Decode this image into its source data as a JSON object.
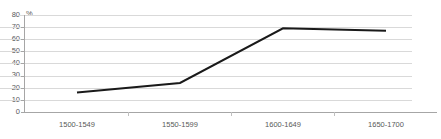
{
  "chart_data": {
    "type": "line",
    "title": "",
    "subtitle": "",
    "xlabel": "",
    "ylabel": "%",
    "unit_label": "%",
    "categories": [
      "1500-1549",
      "1550-1599",
      "1600-1649",
      "1650-1700"
    ],
    "values": [
      16,
      24,
      69,
      67
    ],
    "series": [
      {
        "name": "",
        "values": [
          16,
          24,
          69,
          67
        ]
      }
    ],
    "ylim": [
      0,
      80
    ],
    "ytick_step": 10,
    "yticks": [
      0,
      10,
      20,
      30,
      40,
      50,
      60,
      70,
      80
    ],
    "ytick_labels": [
      "0",
      "10",
      "20",
      "30",
      "40",
      "50",
      "60",
      "70",
      "80"
    ],
    "grid": true,
    "grid_axis": "y",
    "legend": false,
    "legend_position": "none",
    "colors": {
      "line": "#1a1a1a",
      "grid": "#d9d9d9",
      "axis": "#a6a6a6",
      "text": "#595959",
      "background": "#ffffff"
    },
    "line_width": 2,
    "markers": false
  }
}
